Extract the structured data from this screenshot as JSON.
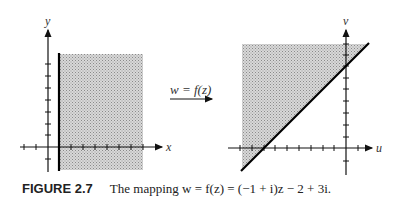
{
  "figure": {
    "caption_label": "FIGURE 2.7",
    "caption_text": "The mapping w = f(z) = (−1 + i)z − 2 + 3i.",
    "mapping_label": "w = f(z)"
  },
  "left_plot": {
    "x_axis_label": "x",
    "y_axis_label": "y",
    "region": "Re(z) ≥ 1 (shaded half-plane to the right of the vertical line x = 1)"
  },
  "right_plot": {
    "x_axis_label": "u",
    "y_axis_label": "v",
    "region": "shaded half-plane above the line v = u + 2"
  }
}
